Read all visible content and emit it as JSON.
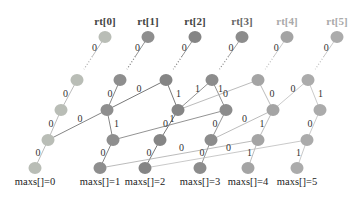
{
  "diagram": {
    "title": "",
    "columns": [
      {
        "root_label": "rt[0]",
        "bottom_label": "maxs[]=0",
        "root_color": "#444444",
        "node_color": "#b9bdb6"
      },
      {
        "root_label": "rt[1]",
        "bottom_label": "maxs[]=1",
        "root_color": "#444444",
        "node_color": "#8e8e8e"
      },
      {
        "root_label": "rt[2]",
        "bottom_label": "maxs[]=2",
        "root_color": "#444444",
        "node_color": "#858585"
      },
      {
        "root_label": "rt[3]",
        "bottom_label": "maxs[]=3",
        "root_color": "#666666",
        "node_color": "#8c8c8c"
      },
      {
        "root_label": "rt[4]",
        "bottom_label": "maxs[]=4",
        "root_color": "#aaaaaa",
        "node_color": "#a4a4a4"
      },
      {
        "root_label": "rt[5]",
        "bottom_label": "maxs[]=5",
        "root_color": "#aaaaaa",
        "node_color": "#ababab"
      }
    ],
    "nodes": [
      {
        "id": "r0",
        "x": 105,
        "y": 37,
        "col": 0
      },
      {
        "id": "r1",
        "x": 148,
        "y": 37,
        "col": 1
      },
      {
        "id": "r2",
        "x": 195,
        "y": 37,
        "col": 2
      },
      {
        "id": "r3",
        "x": 242,
        "y": 37,
        "col": 3
      },
      {
        "id": "r4",
        "x": 287,
        "y": 37,
        "col": 4
      },
      {
        "id": "r5",
        "x": 337,
        "y": 37,
        "col": 5
      },
      {
        "id": "a0",
        "x": 77,
        "y": 80,
        "col": 0
      },
      {
        "id": "a1",
        "x": 120,
        "y": 80,
        "col": 1
      },
      {
        "id": "a2",
        "x": 166,
        "y": 80,
        "col": 2
      },
      {
        "id": "a3",
        "x": 212,
        "y": 80,
        "col": 3
      },
      {
        "id": "a4",
        "x": 258,
        "y": 80,
        "col": 4
      },
      {
        "id": "a5",
        "x": 308,
        "y": 80,
        "col": 5
      },
      {
        "id": "b0",
        "x": 61,
        "y": 110,
        "col": 0
      },
      {
        "id": "b1",
        "x": 107,
        "y": 110,
        "col": 1
      },
      {
        "id": "b2",
        "x": 178,
        "y": 110,
        "col": 2
      },
      {
        "id": "b3",
        "x": 226,
        "y": 110,
        "col": 3
      },
      {
        "id": "b4",
        "x": 273,
        "y": 110,
        "col": 4
      },
      {
        "id": "b5",
        "x": 320,
        "y": 110,
        "col": 5
      },
      {
        "id": "c0",
        "x": 48,
        "y": 140,
        "col": 0
      },
      {
        "id": "c1",
        "x": 113,
        "y": 140,
        "col": 1
      },
      {
        "id": "c2",
        "x": 160,
        "y": 140,
        "col": 2
      },
      {
        "id": "c3",
        "x": 211,
        "y": 140,
        "col": 3
      },
      {
        "id": "c4",
        "x": 258,
        "y": 140,
        "col": 4
      },
      {
        "id": "c5",
        "x": 307,
        "y": 140,
        "col": 5
      },
      {
        "id": "d0",
        "x": 35,
        "y": 168,
        "col": 0
      },
      {
        "id": "d1",
        "x": 100,
        "y": 168,
        "col": 1
      },
      {
        "id": "d2",
        "x": 145,
        "y": 168,
        "col": 2
      },
      {
        "id": "d3",
        "x": 200,
        "y": 168,
        "col": 3
      },
      {
        "id": "d4",
        "x": 248,
        "y": 168,
        "col": 4
      },
      {
        "id": "d5",
        "x": 297,
        "y": 168,
        "col": 5
      }
    ],
    "edges": [
      {
        "from": "r0",
        "to": "a0",
        "label": "0",
        "dotted": true,
        "color": "#aaaaaa"
      },
      {
        "from": "r1",
        "to": "a1",
        "label": "0",
        "dotted": true,
        "color": "#777777"
      },
      {
        "from": "r2",
        "to": "a2",
        "label": "0",
        "dotted": true,
        "color": "#777777"
      },
      {
        "from": "r3",
        "to": "a3",
        "label": "0",
        "dotted": true,
        "color": "#888888"
      },
      {
        "from": "r4",
        "to": "a4",
        "label": "0",
        "dotted": true,
        "color": "#bbbbbb"
      },
      {
        "from": "r5",
        "to": "a5",
        "label": "0",
        "dotted": true,
        "color": "#bbbbbb"
      },
      {
        "from": "a0",
        "to": "b0",
        "label": "0",
        "color": "#aaaaaa"
      },
      {
        "from": "b0",
        "to": "c0",
        "label": "0",
        "color": "#aaaaaa"
      },
      {
        "from": "c0",
        "to": "d0",
        "label": "0",
        "color": "#aaaaaa"
      },
      {
        "from": "a1",
        "to": "b1",
        "label": "0",
        "color": "#666666"
      },
      {
        "from": "b1",
        "to": "c0",
        "label": "0",
        "color": "#666666"
      },
      {
        "from": "b1",
        "to": "c1",
        "label": "1",
        "color": "#666666"
      },
      {
        "from": "c1",
        "to": "d1",
        "label": "0",
        "color": "#666666"
      },
      {
        "from": "a2",
        "to": "b1",
        "label": "0",
        "color": "#555555"
      },
      {
        "from": "a2",
        "to": "b2",
        "label": "1",
        "color": "#555555"
      },
      {
        "from": "b2",
        "to": "c2",
        "label": "0",
        "color": "#555555"
      },
      {
        "from": "c2",
        "to": "d2",
        "label": "0",
        "color": "#555555"
      },
      {
        "from": "a3",
        "to": "b2",
        "label": "1",
        "color": "#777777"
      },
      {
        "from": "a3",
        "to": "b3",
        "label": "0",
        "color": "#777777"
      },
      {
        "from": "b3",
        "to": "c1",
        "label": "1",
        "color": "#777777"
      },
      {
        "from": "b3",
        "to": "c3",
        "label": "0",
        "color": "#777777"
      },
      {
        "from": "c3",
        "to": "d3",
        "label": "0",
        "color": "#777777"
      },
      {
        "from": "a4",
        "to": "b2",
        "label": "1",
        "color": "#aaaaaa"
      },
      {
        "from": "a4",
        "to": "b4",
        "label": "0",
        "color": "#aaaaaa"
      },
      {
        "from": "b4",
        "to": "c3",
        "label": "0",
        "color": "#aaaaaa"
      },
      {
        "from": "b4",
        "to": "c4",
        "label": "1",
        "color": "#aaaaaa"
      },
      {
        "from": "c4",
        "to": "d4",
        "label": "1",
        "color": "#aaaaaa"
      },
      {
        "from": "c4",
        "to": "d1",
        "label": "0",
        "color": "#aaaaaa"
      },
      {
        "from": "a5",
        "to": "b4",
        "label": "0",
        "color": "#bbbbbb"
      },
      {
        "from": "a5",
        "to": "b5",
        "label": "1",
        "color": "#bbbbbb"
      },
      {
        "from": "b5",
        "to": "c5",
        "label": "0",
        "color": "#bbbbbb"
      },
      {
        "from": "c5",
        "to": "d5",
        "label": "1",
        "color": "#bbbbbb"
      },
      {
        "from": "c5",
        "to": "d2",
        "label": "0",
        "color": "#bbbbbb"
      }
    ]
  }
}
